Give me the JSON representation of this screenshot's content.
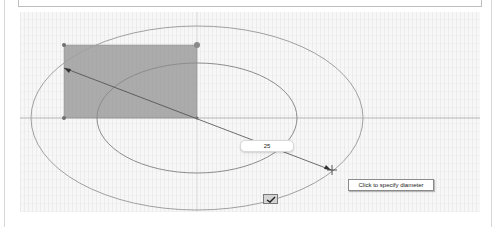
{
  "sketch": {
    "center": {
      "x": 197,
      "y": 118
    },
    "rectangle": {
      "x": 64,
      "y": 45,
      "width": 133,
      "height": 73,
      "fill": "#9e9e9e"
    },
    "inner_circle": {
      "rx": 100,
      "ry": 55
    },
    "outer_circle": {
      "rx": 166,
      "ry": 92
    },
    "diameter_line": {
      "x1": 64,
      "y1": 68,
      "x2": 331,
      "y2": 170
    },
    "colors": {
      "curve": "#8c8c8c",
      "axis": "#b5b5b5",
      "line": "#4a4a4a"
    }
  },
  "dimension_input": {
    "value": "25"
  },
  "tooltip": {
    "text": "Click to specify diameter"
  },
  "ok_button": {
    "icon": "checkmark-icon"
  }
}
